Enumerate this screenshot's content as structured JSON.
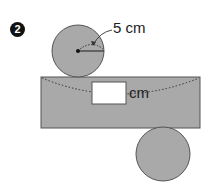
{
  "problem": {
    "number": "2",
    "radius_label": "5 cm",
    "answer_unit": "cm",
    "answer_value": ""
  },
  "colors": {
    "fill": "#a9a9a9",
    "stroke": "#555555",
    "answer_box": "#ffffff"
  }
}
